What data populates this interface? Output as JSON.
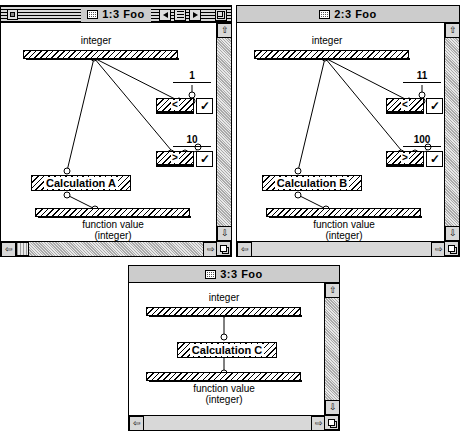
{
  "windows": [
    {
      "id": "w1",
      "title": "1:3 Foo",
      "active": true,
      "input_label": "integer",
      "output_label_line1": "function value",
      "output_label_line2": "(integer)",
      "calc_label": "Calculation A",
      "conditions": [
        {
          "constant": "1",
          "operator": "<",
          "checked": "✓"
        },
        {
          "constant": "10",
          "operator": ">",
          "checked": "✓"
        }
      ],
      "titlebar_controls": [
        "prev-arrow",
        "list-menu",
        "next-arrow",
        "zoom-box"
      ],
      "has_close_box": true,
      "scroll": {
        "h_thumb": true,
        "v_thumb": false
      }
    },
    {
      "id": "w2",
      "title": "2:3 Foo",
      "active": false,
      "input_label": "integer",
      "output_label_line1": "function value",
      "output_label_line2": "(integer)",
      "calc_label": "Calculation B",
      "conditions": [
        {
          "constant": "11",
          "operator": "<",
          "checked": "✓"
        },
        {
          "constant": "100",
          "operator": ">",
          "checked": "✓"
        }
      ],
      "titlebar_controls": [],
      "has_close_box": false,
      "scroll": {
        "h_thumb": false,
        "v_thumb": false
      }
    },
    {
      "id": "w3",
      "title": "3:3 Foo",
      "active": false,
      "input_label": "integer",
      "output_label_line1": "function value",
      "output_label_line2": "(integer)",
      "calc_label": "Calculation C",
      "conditions": [],
      "titlebar_controls": [],
      "has_close_box": false,
      "scroll": {
        "h_thumb": false,
        "v_thumb": false
      }
    }
  ],
  "icons": {
    "document": "document-icon",
    "up_arrow": "⇧",
    "down_arrow": "⇩",
    "left_arrow": "⇦",
    "right_arrow": "⇨"
  }
}
